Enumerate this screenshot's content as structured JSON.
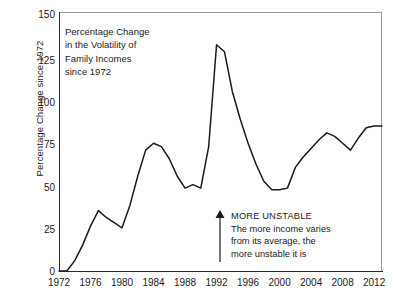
{
  "chart_data": {
    "type": "line",
    "title": "Percentage Change in the Volatility of Family Incomes since 1972",
    "title_lines": [
      "Percentage Change",
      "in the Volatility of",
      "Family Incomes",
      "since 1972"
    ],
    "xlabel": "",
    "ylabel": "Percentage Change since 1972",
    "ylim": [
      0,
      150
    ],
    "xlim": [
      1972,
      2013
    ],
    "yticks": [
      0,
      25,
      50,
      75,
      100,
      125,
      150
    ],
    "ytick_labels": [
      "0",
      "25",
      "50",
      "75",
      "100",
      "125",
      "150"
    ],
    "xticks": [
      1972,
      1976,
      1980,
      1984,
      1988,
      1992,
      1996,
      2000,
      2004,
      2008,
      2012
    ],
    "xtick_labels": [
      "1972",
      "1976",
      "1980",
      "1984",
      "1988",
      "1992",
      "1996",
      "2000",
      "2004",
      "2008",
      "2012"
    ],
    "grid": false,
    "legend": null,
    "line_color": "#1a1a1a",
    "frame_color": "#9a9a9a",
    "background": "#ffffff",
    "series": [
      {
        "name": "Percentage Change since 1972",
        "x": [
          1972,
          1973,
          1974,
          1975,
          1976,
          1977,
          1978,
          1979,
          1980,
          1981,
          1982,
          1983,
          1984,
          1985,
          1986,
          1987,
          1988,
          1989,
          1990,
          1991,
          1992,
          1993,
          1994,
          1995,
          1996,
          1997,
          1998,
          1999,
          2000,
          2001,
          2002,
          2003,
          2004,
          2005,
          2006,
          2007,
          2008,
          2009,
          2010,
          2011,
          2012,
          2013
        ],
        "values": [
          0,
          0,
          6,
          15,
          26,
          35,
          31,
          28,
          25,
          38,
          55,
          70,
          74,
          72,
          65,
          55,
          48,
          50,
          48,
          72,
          131,
          127,
          104,
          88,
          74,
          62,
          52,
          47,
          47,
          48,
          60,
          66,
          71,
          76,
          80,
          78,
          74,
          70,
          77,
          83,
          84,
          84
        ]
      }
    ],
    "annotations": [
      {
        "name": "more-unstable-note",
        "arrow": "up",
        "lines": [
          "MORE UNSTABLE",
          "The more income varies",
          "from its average, the",
          "more unstable it is"
        ]
      }
    ]
  }
}
